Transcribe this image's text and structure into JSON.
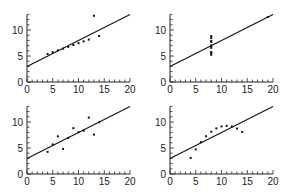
{
  "chart_data": [
    {
      "type": "scatter",
      "title": "",
      "xlabel": "",
      "ylabel": "",
      "xlim": [
        0,
        20
      ],
      "ylim": [
        0,
        13
      ],
      "xticks": [
        "0",
        "5",
        "10",
        "15",
        "20"
      ],
      "yticks": [
        "0",
        "5",
        "10"
      ],
      "grid": false,
      "x": [
        10,
        8,
        13,
        9,
        11,
        14,
        6,
        4,
        12,
        7,
        5
      ],
      "y": [
        7.46,
        6.77,
        12.74,
        7.11,
        7.81,
        8.84,
        6.08,
        5.39,
        8.15,
        6.42,
        5.73
      ],
      "fit_line": {
        "intercept": 3.0,
        "slope": 0.5
      }
    },
    {
      "type": "scatter",
      "title": "",
      "xlabel": "",
      "ylabel": "",
      "xlim": [
        0,
        20
      ],
      "ylim": [
        0,
        13
      ],
      "xticks": [
        "0",
        "5",
        "10",
        "15",
        "20"
      ],
      "yticks": [
        "0",
        "5",
        "10"
      ],
      "grid": false,
      "x": [
        8,
        8,
        8,
        8,
        8,
        8,
        8,
        19,
        8,
        8,
        8
      ],
      "y": [
        6.58,
        5.76,
        7.71,
        8.84,
        8.47,
        7.04,
        5.25,
        12.5,
        5.56,
        7.91,
        6.89
      ],
      "fit_line": {
        "intercept": 3.0,
        "slope": 0.5
      }
    },
    {
      "type": "scatter",
      "title": "",
      "xlabel": "",
      "ylabel": "",
      "xlim": [
        0,
        20
      ],
      "ylim": [
        0,
        13
      ],
      "xticks": [
        "0",
        "5",
        "10",
        "15",
        "20"
      ],
      "yticks": [
        "0",
        "5",
        "10"
      ],
      "grid": false,
      "x": [
        10,
        8,
        13,
        9,
        11,
        14,
        6,
        4,
        12,
        7,
        5
      ],
      "y": [
        8.04,
        6.95,
        7.58,
        8.81,
        8.33,
        9.96,
        7.24,
        4.26,
        10.84,
        4.82,
        5.68
      ],
      "fit_line": {
        "intercept": 3.0,
        "slope": 0.5
      }
    },
    {
      "type": "scatter",
      "title": "",
      "xlabel": "",
      "ylabel": "",
      "xlim": [
        0,
        20
      ],
      "ylim": [
        0,
        13
      ],
      "xticks": [
        "0",
        "5",
        "10",
        "15",
        "20"
      ],
      "yticks": [
        "0",
        "5",
        "10"
      ],
      "grid": false,
      "x": [
        10,
        8,
        13,
        9,
        11,
        14,
        6,
        4,
        12,
        7,
        5
      ],
      "y": [
        9.14,
        8.14,
        8.74,
        8.77,
        9.26,
        8.1,
        6.13,
        3.1,
        9.13,
        7.26,
        4.74
      ],
      "fit_line": {
        "intercept": 3.0,
        "slope": 0.5
      }
    }
  ]
}
